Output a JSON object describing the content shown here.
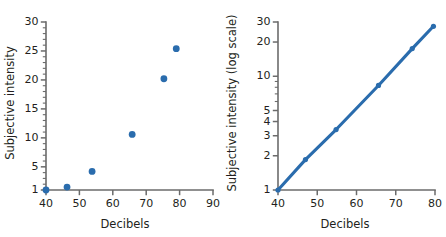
{
  "figure": {
    "background": "#ffffff",
    "accent_color": "#2a6cad",
    "axis_color": "#6b6b6b",
    "text_color": "#231f20"
  },
  "chart_data": [
    {
      "id": "linear-panel",
      "type": "scatter",
      "title": "",
      "xlabel": "Decibels",
      "ylabel": "Subjective intensity",
      "xlim": [
        40,
        90
      ],
      "ylim": [
        1,
        30
      ],
      "xscale": "linear",
      "yscale": "linear",
      "grid": false,
      "legend": "none",
      "xticks": [
        40,
        50,
        60,
        70,
        80,
        90
      ],
      "xticklabels": [
        "40",
        "50",
        "60",
        "70",
        "80",
        "90"
      ],
      "yticks": [
        1,
        5,
        10,
        15,
        20,
        25,
        30
      ],
      "yticklabels": [
        "1",
        "5",
        "10",
        "15",
        "20",
        "25",
        "30"
      ],
      "y_minor_step": 1,
      "marker_radius": 3.4,
      "points": [
        {
          "x": 40.0,
          "y": 1.0
        },
        {
          "x": 46.3,
          "y": 1.5
        },
        {
          "x": 53.8,
          "y": 4.2
        },
        {
          "x": 65.8,
          "y": 10.6
        },
        {
          "x": 75.3,
          "y": 20.2
        },
        {
          "x": 79.0,
          "y": 25.4
        }
      ]
    },
    {
      "id": "log-panel",
      "type": "line",
      "title": "",
      "xlabel": "Decibels",
      "ylabel": "Subjective intensity (log scale)",
      "xlim": [
        40,
        80
      ],
      "ylim": [
        1,
        30
      ],
      "xscale": "linear",
      "yscale": "log",
      "grid": false,
      "legend": "none",
      "xticks": [
        40,
        50,
        60,
        70,
        80
      ],
      "xticklabels": [
        "40",
        "50",
        "60",
        "70",
        "80"
      ],
      "yticks": [
        1,
        2,
        3,
        4,
        5,
        10,
        20,
        30
      ],
      "yticklabels": [
        "1",
        "2",
        "3",
        "4",
        "5",
        "10",
        "20",
        "30"
      ],
      "y_minor_ticks": [
        6,
        7,
        8,
        9
      ],
      "marker_radius": 2.6,
      "line_width": 3.1,
      "points": [
        {
          "x": 40.0,
          "y": 1.0
        },
        {
          "x": 47.0,
          "y": 1.85
        },
        {
          "x": 54.8,
          "y": 3.4
        },
        {
          "x": 65.6,
          "y": 8.3
        },
        {
          "x": 74.2,
          "y": 17.5
        },
        {
          "x": 79.6,
          "y": 27.5
        }
      ]
    }
  ]
}
